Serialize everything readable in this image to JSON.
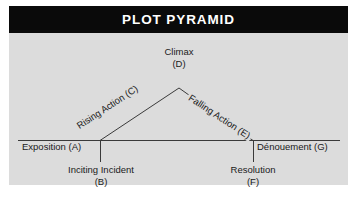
{
  "header": {
    "title": "PLOT PYRAMID"
  },
  "colors": {
    "header_background": "#0a0a0a",
    "header_text": "#ffffff",
    "panel_background": "#dcdcdc",
    "line": "#3a3a3a",
    "label_text": "#1a1a1a",
    "canvas": "#ffffff"
  },
  "diagram": {
    "type": "plot-pyramid",
    "labels": {
      "climax": {
        "name": "Climax",
        "key": "(D)"
      },
      "rising_action": {
        "text": "Rising Action (C)"
      },
      "falling_action": {
        "text": "Falling Action (E)"
      },
      "exposition": {
        "text": "Exposition (A)"
      },
      "denouement": {
        "text": "Dénouement (G)"
      },
      "inciting_incident": {
        "name": "Inciting Incident",
        "key": "(B)"
      },
      "resolution": {
        "name": "Resolution",
        "key": "(F)"
      }
    }
  }
}
